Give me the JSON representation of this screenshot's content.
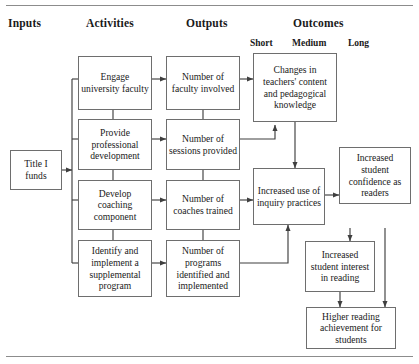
{
  "diagram": {
    "title_rules": {
      "top": "",
      "bottom": ""
    },
    "columns": [
      {
        "key": "inputs",
        "label": "Inputs"
      },
      {
        "key": "activities",
        "label": "Activities"
      },
      {
        "key": "outputs",
        "label": "Outputs"
      },
      {
        "key": "outcomes",
        "label": "Outcomes"
      }
    ],
    "outcome_subcolumns": [
      {
        "key": "short",
        "label": "Short"
      },
      {
        "key": "medium",
        "label": "Medium"
      },
      {
        "key": "long",
        "label": "Long"
      }
    ],
    "nodes": {
      "title_i_funds": "Title I funds",
      "engage_faculty": "Engage university faculty",
      "provide_pd": "Provide professional development",
      "develop_coaching": "Develop coaching component",
      "identify_program": "Identify and implement a supplemental program",
      "num_faculty": "Number of faculty involved",
      "num_sessions": "Number of sessions provided",
      "num_coaches": "Number of coaches trained",
      "num_programs": "Number of programs identified and implemented",
      "teacher_knowledge": "Changes in teachers' content and pedagogical knowledge",
      "inquiry_practices": "Increased use of inquiry practices",
      "student_confidence": "Increased student confidence as readers",
      "student_interest": "Increased student interest in reading",
      "reading_achievement": "Higher reading achievement for students"
    }
  },
  "colors": {
    "box_border": "#6e6e6e",
    "connector": "#3f3f3f",
    "rule": "#8c8c8c",
    "text": "#1a1a1a",
    "background": "#ffffff"
  }
}
